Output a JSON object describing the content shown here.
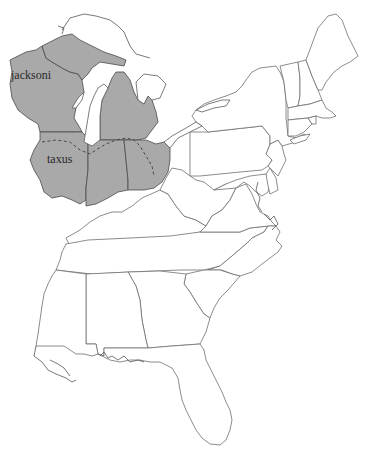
{
  "map": {
    "region": "Eastern United States",
    "labels": [
      {
        "id": "jacksoni",
        "text": "jacksoni"
      },
      {
        "id": "taxus",
        "text": "taxus"
      }
    ],
    "shaded_range": {
      "description": "Subspecies range (shaded): Wisconsin, Michigan, Illinois, Indiana, Ohio",
      "fill": "#a9a9a9",
      "boundary_style": "dashed line separating jacksoni (north) from taxus (south)"
    },
    "colors": {
      "background": "#ffffff",
      "range_fill": "#a9a9a9",
      "outline": "#6e6e6e"
    }
  }
}
